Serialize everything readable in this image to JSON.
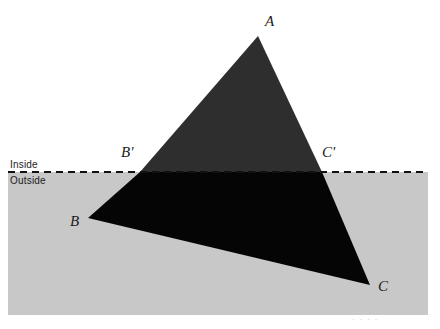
{
  "figure": {
    "canvas": {
      "width": 440,
      "height": 329,
      "background": "#ffffff"
    },
    "colors": {
      "outside_region_fill": "#c8c8c8",
      "inside_triangle_fill": "#2e2e2e",
      "outside_triangle_fill": "#050505",
      "clip_line": "#111111",
      "label_text": "#1a1a1a"
    },
    "clip_line": {
      "name": "boundary-line",
      "style": "dashed",
      "y": 172,
      "x_start": 8,
      "x_end": 428,
      "dash": "7 5",
      "width": 2
    },
    "outside_region": {
      "x": 8,
      "y": 172,
      "width": 420,
      "height": 143
    },
    "region_labels": [
      {
        "id": "inside",
        "text": "Inside",
        "x": 10,
        "y": 160
      },
      {
        "id": "outside",
        "text": "Outside",
        "x": 10,
        "y": 176
      }
    ],
    "polygon": {
      "name": "triangle-ABC",
      "vertices": [
        {
          "id": "A",
          "x": 258,
          "y": 36
        },
        {
          "id": "B",
          "x": 88,
          "y": 218
        },
        {
          "id": "C",
          "x": 370,
          "y": 285
        }
      ],
      "intersections": [
        {
          "id": "B'",
          "x": 140,
          "y": 172
        },
        {
          "id": "C'",
          "x": 322,
          "y": 172
        }
      ],
      "inside_part": "A, B', C'",
      "outside_part": "B', B, C, C'"
    },
    "vertex_labels": [
      {
        "id": "A",
        "text": "A",
        "x": 265,
        "y": 14
      },
      {
        "id": "Bp",
        "text": "B'",
        "x": 121,
        "y": 145
      },
      {
        "id": "Cp",
        "text": "C'",
        "x": 322,
        "y": 145
      },
      {
        "id": "B",
        "text": "B",
        "x": 70,
        "y": 214
      },
      {
        "id": "C",
        "text": "C",
        "x": 378,
        "y": 279
      }
    ],
    "footer_artifact": {
      "text": "· · · ·"
    }
  }
}
